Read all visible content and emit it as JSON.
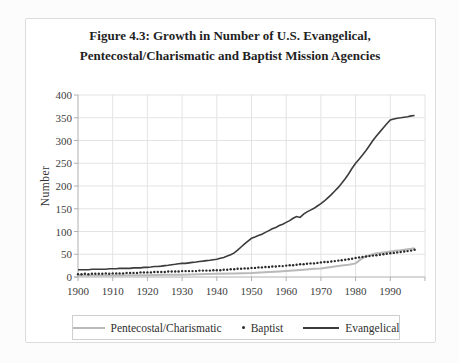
{
  "figure": {
    "title_line1": "Figure 4.3: Growth in Number of U.S. Evangelical,",
    "title_line2": "Pentecostal/Charismatic and Baptist Mission Agencies",
    "border_color": "#dcdcdc",
    "background": "#ffffff"
  },
  "axes": {
    "ylabel": "Number",
    "tick_color": "#3d3d3d",
    "axis_color": "#b0b0b0",
    "grid_color": "#e3e3e3"
  },
  "legend": {
    "items": [
      {
        "label": "Pentecostal/Charismatic",
        "swatch": "line",
        "color": "#b9b9b9"
      },
      {
        "label": "Baptist",
        "swatch": "dot",
        "color": "#2b2b2b"
      },
      {
        "label": "Evangelical",
        "swatch": "line",
        "color": "#3b3b3b"
      }
    ]
  },
  "chart_data": {
    "type": "line",
    "title": "Figure 4.3: Growth in Number of U.S. Evangelical, Pentecostal/Charismatic and Baptist Mission Agencies",
    "xlabel": "",
    "ylabel": "Number",
    "xlim": [
      1900,
      2000
    ],
    "ylim": [
      0,
      400
    ],
    "xticks": [
      1900,
      1910,
      1920,
      1930,
      1940,
      1950,
      1960,
      1970,
      1980,
      1990
    ],
    "yticks": [
      0,
      50,
      100,
      150,
      200,
      250,
      300,
      350,
      400
    ],
    "grid": true,
    "legend_position": "bottom",
    "series": [
      {
        "name": "Pentecostal/Charismatic",
        "type": "line",
        "color": "#b9b9b9",
        "width": 2,
        "points": [
          [
            1900,
            3
          ],
          [
            1905,
            3
          ],
          [
            1910,
            3
          ],
          [
            1915,
            4
          ],
          [
            1920,
            4
          ],
          [
            1925,
            5
          ],
          [
            1930,
            5
          ],
          [
            1935,
            6
          ],
          [
            1940,
            7
          ],
          [
            1945,
            8
          ],
          [
            1950,
            9
          ],
          [
            1955,
            11
          ],
          [
            1958,
            12
          ],
          [
            1960,
            13
          ],
          [
            1962,
            14
          ],
          [
            1965,
            16
          ],
          [
            1968,
            18
          ],
          [
            1970,
            19
          ],
          [
            1972,
            21
          ],
          [
            1974,
            23
          ],
          [
            1976,
            25
          ],
          [
            1978,
            27
          ],
          [
            1980,
            30
          ],
          [
            1981,
            36
          ],
          [
            1982,
            42
          ],
          [
            1983,
            45
          ],
          [
            1984,
            48
          ],
          [
            1985,
            50
          ],
          [
            1986,
            52
          ],
          [
            1987,
            53
          ],
          [
            1988,
            54
          ],
          [
            1989,
            55
          ],
          [
            1990,
            56
          ],
          [
            1991,
            57
          ],
          [
            1992,
            58
          ],
          [
            1993,
            59
          ],
          [
            1994,
            60
          ],
          [
            1995,
            61
          ],
          [
            1996,
            62
          ],
          [
            1997,
            63
          ]
        ]
      },
      {
        "name": "Baptist",
        "type": "scatter",
        "color": "#2b2b2b",
        "marker": "dot",
        "points": [
          [
            1900,
            6
          ],
          [
            1901,
            6
          ],
          [
            1902,
            7
          ],
          [
            1903,
            6
          ],
          [
            1904,
            7
          ],
          [
            1905,
            7
          ],
          [
            1906,
            7
          ],
          [
            1907,
            7
          ],
          [
            1908,
            8
          ],
          [
            1909,
            7
          ],
          [
            1910,
            8
          ],
          [
            1911,
            8
          ],
          [
            1912,
            8
          ],
          [
            1913,
            8
          ],
          [
            1914,
            9
          ],
          [
            1915,
            9
          ],
          [
            1916,
            9
          ],
          [
            1917,
            9
          ],
          [
            1918,
            10
          ],
          [
            1919,
            10
          ],
          [
            1920,
            10
          ],
          [
            1921,
            10
          ],
          [
            1922,
            11
          ],
          [
            1923,
            11
          ],
          [
            1924,
            11
          ],
          [
            1925,
            11
          ],
          [
            1926,
            12
          ],
          [
            1927,
            12
          ],
          [
            1928,
            12
          ],
          [
            1929,
            12
          ],
          [
            1930,
            13
          ],
          [
            1931,
            13
          ],
          [
            1932,
            13
          ],
          [
            1933,
            13
          ],
          [
            1934,
            13
          ],
          [
            1935,
            14
          ],
          [
            1936,
            14
          ],
          [
            1937,
            14
          ],
          [
            1938,
            14
          ],
          [
            1939,
            15
          ],
          [
            1940,
            15
          ],
          [
            1941,
            15
          ],
          [
            1942,
            16
          ],
          [
            1943,
            16
          ],
          [
            1944,
            17
          ],
          [
            1945,
            17
          ],
          [
            1946,
            18
          ],
          [
            1947,
            18
          ],
          [
            1948,
            19
          ],
          [
            1949,
            19
          ],
          [
            1950,
            20
          ],
          [
            1951,
            20
          ],
          [
            1952,
            21
          ],
          [
            1953,
            21
          ],
          [
            1954,
            22
          ],
          [
            1955,
            22
          ],
          [
            1956,
            23
          ],
          [
            1957,
            23
          ],
          [
            1958,
            24
          ],
          [
            1959,
            24
          ],
          [
            1960,
            25
          ],
          [
            1961,
            26
          ],
          [
            1962,
            26
          ],
          [
            1963,
            27
          ],
          [
            1964,
            28
          ],
          [
            1965,
            28
          ],
          [
            1966,
            29
          ],
          [
            1967,
            30
          ],
          [
            1968,
            30
          ],
          [
            1969,
            31
          ],
          [
            1970,
            32
          ],
          [
            1971,
            33
          ],
          [
            1972,
            33
          ],
          [
            1973,
            34
          ],
          [
            1974,
            35
          ],
          [
            1975,
            36
          ],
          [
            1976,
            37
          ],
          [
            1977,
            38
          ],
          [
            1978,
            39
          ],
          [
            1979,
            40
          ],
          [
            1980,
            42
          ],
          [
            1981,
            43
          ],
          [
            1982,
            44
          ],
          [
            1983,
            45
          ],
          [
            1984,
            46
          ],
          [
            1985,
            47
          ],
          [
            1986,
            48
          ],
          [
            1987,
            49
          ],
          [
            1988,
            50
          ],
          [
            1989,
            51
          ],
          [
            1990,
            52
          ],
          [
            1991,
            53
          ],
          [
            1992,
            54
          ],
          [
            1993,
            55
          ],
          [
            1994,
            56
          ],
          [
            1995,
            57
          ],
          [
            1996,
            58
          ],
          [
            1997,
            60
          ]
        ]
      },
      {
        "name": "Evangelical",
        "type": "line",
        "color": "#3b3b3b",
        "width": 1.6,
        "points": [
          [
            1900,
            16
          ],
          [
            1901,
            16
          ],
          [
            1902,
            16
          ],
          [
            1903,
            16
          ],
          [
            1904,
            17
          ],
          [
            1905,
            17
          ],
          [
            1906,
            17
          ],
          [
            1907,
            17
          ],
          [
            1908,
            17
          ],
          [
            1909,
            18
          ],
          [
            1910,
            18
          ],
          [
            1911,
            18
          ],
          [
            1912,
            19
          ],
          [
            1913,
            19
          ],
          [
            1914,
            19
          ],
          [
            1915,
            19
          ],
          [
            1916,
            20
          ],
          [
            1917,
            20
          ],
          [
            1918,
            20
          ],
          [
            1919,
            21
          ],
          [
            1920,
            21
          ],
          [
            1921,
            22
          ],
          [
            1922,
            23
          ],
          [
            1923,
            23
          ],
          [
            1924,
            24
          ],
          [
            1925,
            25
          ],
          [
            1926,
            26
          ],
          [
            1927,
            27
          ],
          [
            1928,
            28
          ],
          [
            1929,
            29
          ],
          [
            1930,
            30
          ],
          [
            1931,
            30
          ],
          [
            1932,
            31
          ],
          [
            1933,
            32
          ],
          [
            1934,
            33
          ],
          [
            1935,
            34
          ],
          [
            1936,
            35
          ],
          [
            1937,
            36
          ],
          [
            1938,
            37
          ],
          [
            1939,
            38
          ],
          [
            1940,
            39
          ],
          [
            1941,
            41
          ],
          [
            1942,
            43
          ],
          [
            1943,
            46
          ],
          [
            1944,
            49
          ],
          [
            1945,
            53
          ],
          [
            1946,
            59
          ],
          [
            1947,
            66
          ],
          [
            1948,
            73
          ],
          [
            1949,
            79
          ],
          [
            1950,
            85
          ],
          [
            1951,
            88
          ],
          [
            1952,
            91
          ],
          [
            1953,
            94
          ],
          [
            1954,
            98
          ],
          [
            1955,
            102
          ],
          [
            1956,
            106
          ],
          [
            1957,
            109
          ],
          [
            1958,
            113
          ],
          [
            1959,
            116
          ],
          [
            1960,
            120
          ],
          [
            1961,
            124
          ],
          [
            1962,
            129
          ],
          [
            1963,
            133
          ],
          [
            1964,
            131
          ],
          [
            1965,
            138
          ],
          [
            1966,
            143
          ],
          [
            1967,
            147
          ],
          [
            1968,
            151
          ],
          [
            1969,
            156
          ],
          [
            1970,
            161
          ],
          [
            1971,
            167
          ],
          [
            1972,
            174
          ],
          [
            1973,
            181
          ],
          [
            1974,
            189
          ],
          [
            1975,
            197
          ],
          [
            1976,
            206
          ],
          [
            1977,
            216
          ],
          [
            1978,
            227
          ],
          [
            1979,
            239
          ],
          [
            1980,
            250
          ],
          [
            1981,
            259
          ],
          [
            1982,
            268
          ],
          [
            1983,
            278
          ],
          [
            1984,
            289
          ],
          [
            1985,
            300
          ],
          [
            1986,
            310
          ],
          [
            1987,
            319
          ],
          [
            1988,
            328
          ],
          [
            1989,
            337
          ],
          [
            1990,
            345
          ],
          [
            1991,
            347
          ],
          [
            1992,
            349
          ],
          [
            1993,
            350
          ],
          [
            1994,
            351
          ],
          [
            1995,
            352
          ],
          [
            1996,
            354
          ],
          [
            1997,
            355
          ]
        ]
      }
    ]
  }
}
